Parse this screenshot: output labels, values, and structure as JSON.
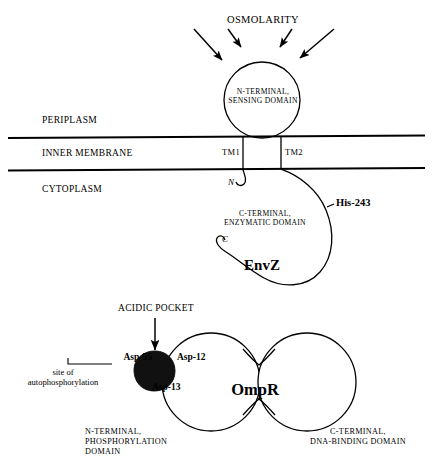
{
  "figure": {
    "stimulus_label": "OSMOLARITY",
    "compartments": {
      "periplasm": "PERIPLASM",
      "inner_membrane": "INNER MEMBRANE",
      "cytoplasm": "CYTOPLASM"
    },
    "envz": {
      "protein_label": "EnvZ",
      "sensing_domain_line1": "N-TERMINAL,",
      "sensing_domain_line2": "SENSING DOMAIN",
      "tm1_label": "TM1",
      "tm2_label": "TM2",
      "n_terminus": "N",
      "c_terminus": "C",
      "enzymatic_domain_line1": "C-TERMINAL,",
      "enzymatic_domain_line2": "ENZYMATIC DOMAIN",
      "phospho_residue": "His-243"
    },
    "ompr": {
      "protein_label": "OmpR",
      "acidic_pocket_label": "ACIDIC POCKET",
      "asp55": "Asp-55",
      "asp12": "Asp-12",
      "asp13": "Asp-13",
      "autophosphorylation_line1": "site of",
      "autophosphorylation_line2": "autophosphorylation",
      "n_domain_line1": "N-TERMINAL,",
      "n_domain_line2": "PHOSPHORYLATION",
      "n_domain_line3": "DOMAIN",
      "c_domain_line1": "C-TERMINAL,",
      "c_domain_line2": "DNA-BINDING DOMAIN"
    },
    "colors": {
      "stroke": "#000000",
      "fill": "#ffffff",
      "acidic_pocket_fill": "#111111",
      "background": "#ffffff"
    }
  }
}
